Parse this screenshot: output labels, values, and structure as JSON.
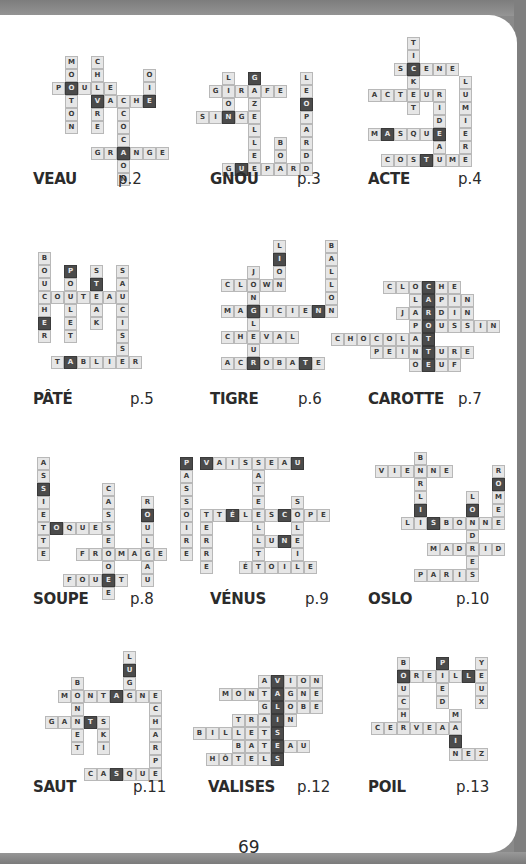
{
  "page_number": "69",
  "colors": {
    "cell_bg": "#e6e6e6",
    "cell_border": "#b8b8b8",
    "highlight_bg": "#4b4b4b",
    "text": "#2b2b2b"
  },
  "puzzles": [
    {
      "answer": "VEAU",
      "page": "p.2",
      "origin": [
        52,
        56
      ],
      "label": [
        33,
        180
      ],
      "pageref": [
        118,
        180
      ],
      "words": [
        [
          "MOUTON",
          0,
          1,
          "v"
        ],
        [
          "CHEVRE",
          0,
          3,
          "v"
        ],
        [
          "POULE",
          2,
          0,
          "h"
        ],
        [
          "VACHE",
          3,
          3,
          "h"
        ],
        [
          "COCHON",
          4,
          5,
          "v"
        ],
        [
          "OIE",
          1,
          7,
          "v"
        ],
        [
          "GRANGE",
          7,
          3,
          "h"
        ]
      ],
      "highlights": [
        [
          2,
          1
        ],
        [
          3,
          3
        ],
        [
          3,
          7
        ],
        [
          7,
          5
        ]
      ]
    },
    {
      "answer": "GNOU",
      "page": "p.3",
      "origin": [
        196,
        72
      ],
      "label": [
        210,
        180
      ],
      "pageref": [
        297,
        180
      ],
      "words": [
        [
          "LION",
          0,
          2,
          "v"
        ],
        [
          "GIRAFE",
          1,
          1,
          "h"
        ],
        [
          "GAZELLE",
          0,
          4,
          "v"
        ],
        [
          "SINGE",
          3,
          0,
          "h"
        ],
        [
          "BOA",
          5,
          6,
          "v"
        ],
        [
          "LEOPARD",
          0,
          8,
          "v"
        ],
        [
          "GUEPARD",
          7,
          2,
          "h"
        ]
      ],
      "highlights": [
        [
          0,
          4
        ],
        [
          3,
          2
        ],
        [
          2,
          8
        ],
        [
          7,
          3
        ]
      ]
    },
    {
      "answer": "ACTE",
      "page": "p.4",
      "origin": [
        368,
        37
      ],
      "label": [
        368,
        180
      ],
      "pageref": [
        458,
        180
      ],
      "words": [
        [
          "TICKET",
          0,
          3,
          "v"
        ],
        [
          "SCENE",
          2,
          2,
          "h"
        ],
        [
          "ACTEUR",
          4,
          0,
          "h"
        ],
        [
          "RIDEAU",
          4,
          5,
          "v"
        ],
        [
          "LUMIERE",
          3,
          7,
          "v"
        ],
        [
          "MASQUE",
          7,
          0,
          "h"
        ],
        [
          "COSTUME",
          9,
          1,
          "h"
        ]
      ],
      "highlights": [
        [
          2,
          3
        ],
        [
          7,
          1
        ],
        [
          7,
          5
        ],
        [
          9,
          4
        ]
      ]
    },
    {
      "answer": "PÂTÉ",
      "page": "p.5",
      "origin": [
        38,
        252
      ],
      "label": [
        33,
        400
      ],
      "pageref": [
        130,
        400
      ],
      "words": [
        [
          "BOUCHER",
          0,
          0,
          "v"
        ],
        [
          "POULET",
          1,
          2,
          "v"
        ],
        [
          "STEAK",
          1,
          4,
          "v"
        ],
        [
          "SAUCISSE",
          1,
          6,
          "v"
        ],
        [
          "COUTEAU",
          3,
          0,
          "h"
        ],
        [
          "TABLIER",
          8,
          1,
          "h"
        ]
      ],
      "highlights": [
        [
          1,
          2
        ],
        [
          2,
          4
        ],
        [
          5,
          0
        ],
        [
          8,
          2
        ]
      ]
    },
    {
      "answer": "TIGRE",
      "page": "p.6",
      "origin": [
        208,
        240
      ],
      "label": [
        210,
        400
      ],
      "pageref": [
        298,
        400
      ],
      "words": [
        [
          "LION",
          0,
          5,
          "v"
        ],
        [
          "BALLON",
          0,
          9,
          "v"
        ],
        [
          "JONGLEUR",
          2,
          3,
          "v"
        ],
        [
          "CLOWN",
          3,
          1,
          "h"
        ],
        [
          "MAGICIEN",
          5,
          1,
          "h"
        ],
        [
          "CHEVAL",
          7,
          1,
          "h"
        ],
        [
          "ACROBATE",
          9,
          1,
          "h"
        ]
      ],
      "highlights": [
        [
          1,
          5
        ],
        [
          5,
          3
        ],
        [
          5,
          8
        ],
        [
          9,
          3
        ],
        [
          9,
          7
        ]
      ]
    },
    {
      "answer": "CAROTTE",
      "page": "p.7",
      "origin": [
        331,
        281
      ],
      "label": [
        368,
        400
      ],
      "pageref": [
        458,
        400
      ],
      "words": [
        [
          "CLOCHE",
          0,
          4,
          "h"
        ],
        [
          "LAPIN",
          1,
          6,
          "h"
        ],
        [
          "JARDIN",
          2,
          5,
          "h"
        ],
        [
          "POUSSIN",
          3,
          6,
          "h"
        ],
        [
          "CHOCOLAT",
          4,
          0,
          "h"
        ],
        [
          "PEINTURE",
          5,
          3,
          "h"
        ],
        [
          "OEUF",
          6,
          6,
          "h"
        ]
      ],
      "highlights": [
        [
          0,
          7
        ],
        [
          1,
          7
        ],
        [
          2,
          7
        ],
        [
          3,
          7
        ],
        [
          4,
          7
        ],
        [
          5,
          7
        ],
        [
          6,
          7
        ]
      ]
    },
    {
      "answer": "SOUPE",
      "page": "p.8",
      "origin": [
        37,
        457
      ],
      "label": [
        33,
        600
      ],
      "pageref": [
        130,
        600
      ],
      "words": [
        [
          "ASSIETTE",
          0,
          0,
          "v"
        ],
        [
          "CASSEROLE",
          2,
          5,
          "v"
        ],
        [
          "ROULEAU",
          3,
          8,
          "v"
        ],
        [
          "PASSOIRE",
          0,
          11,
          "v"
        ],
        [
          "TOQUE",
          5,
          0,
          "h"
        ],
        [
          "FROMAGE",
          7,
          3,
          "h"
        ],
        [
          "FOUET",
          9,
          2,
          "h"
        ]
      ],
      "highlights": [
        [
          2,
          0
        ],
        [
          5,
          1
        ],
        [
          4,
          8
        ],
        [
          0,
          11
        ],
        [
          9,
          5
        ]
      ]
    },
    {
      "answer": "VÉNUS",
      "page": "p.9",
      "origin": [
        200,
        457
      ],
      "label": [
        210,
        600
      ],
      "pageref": [
        305,
        600
      ],
      "words": [
        [
          "VAISSEAU",
          0,
          0,
          "h"
        ],
        [
          "SATELLITE",
          0,
          4,
          "v"
        ],
        [
          "TÉLESCOPE",
          4,
          1,
          "h"
        ],
        [
          "SOLEIL",
          3,
          7,
          "v"
        ],
        [
          "TERRE",
          4,
          0,
          "v"
        ],
        [
          "LUNE",
          6,
          4,
          "h"
        ],
        [
          "ÉTOILE",
          8,
          3,
          "h"
        ]
      ],
      "highlights": [
        [
          0,
          0
        ],
        [
          0,
          7
        ],
        [
          4,
          2
        ],
        [
          4,
          6
        ],
        [
          6,
          6
        ]
      ]
    },
    {
      "answer": "OSLO",
      "page": "p.10",
      "origin": [
        375,
        452
      ],
      "label": [
        368,
        600
      ],
      "pageref": [
        456,
        600
      ],
      "words": [
        [
          "BERLIN",
          0,
          3,
          "v"
        ],
        [
          "VIENNE",
          1,
          0,
          "h"
        ],
        [
          "ROME",
          1,
          9,
          "v"
        ],
        [
          "LONDRES",
          3,
          7,
          "v"
        ],
        [
          "LISBONNE",
          5,
          2,
          "h"
        ],
        [
          "MADRID",
          7,
          4,
          "h"
        ],
        [
          "PARIS",
          9,
          3,
          "h"
        ]
      ],
      "highlights": [
        [
          4,
          3
        ],
        [
          5,
          4
        ],
        [
          4,
          7
        ],
        [
          2,
          9
        ]
      ]
    },
    {
      "answer": "SAUT",
      "page": "p.11",
      "origin": [
        45,
        651
      ],
      "label": [
        33,
        788
      ],
      "pageref": [
        133,
        788
      ],
      "words": [
        [
          "LUGE",
          0,
          6,
          "v"
        ],
        [
          "BONNET",
          2,
          2,
          "v"
        ],
        [
          "MONTAGNE",
          3,
          1,
          "h"
        ],
        [
          "ECHARPE",
          3,
          8,
          "v"
        ],
        [
          "GANTS",
          5,
          0,
          "h"
        ],
        [
          "SKI",
          5,
          4,
          "v"
        ],
        [
          "CASQUE",
          9,
          3,
          "h"
        ]
      ],
      "highlights": [
        [
          1,
          6
        ],
        [
          3,
          5
        ],
        [
          5,
          3
        ],
        [
          9,
          5
        ]
      ]
    },
    {
      "answer": "VALISES",
      "page": "p.12",
      "origin": [
        193,
        675
      ],
      "label": [
        208,
        788
      ],
      "pageref": [
        297,
        788
      ],
      "words": [
        [
          "AVION",
          0,
          5,
          "h"
        ],
        [
          "MONTAGNE",
          1,
          2,
          "h"
        ],
        [
          "GLOBE",
          2,
          5,
          "h"
        ],
        [
          "TRAIN",
          3,
          3,
          "h"
        ],
        [
          "BILLETS",
          4,
          0,
          "h"
        ],
        [
          "BATEAU",
          5,
          3,
          "h"
        ],
        [
          "HÔTELS",
          6,
          1,
          "h"
        ]
      ],
      "highlights": [
        [
          0,
          6
        ],
        [
          1,
          6
        ],
        [
          2,
          6
        ],
        [
          3,
          6
        ],
        [
          4,
          6
        ],
        [
          5,
          6
        ],
        [
          6,
          6
        ]
      ]
    },
    {
      "answer": "POIL",
      "page": "p.13",
      "origin": [
        371,
        657
      ],
      "label": [
        368,
        788
      ],
      "pageref": [
        456,
        788
      ],
      "words": [
        [
          "BOUCHE",
          0,
          2,
          "v"
        ],
        [
          "OREILLE",
          1,
          2,
          "h"
        ],
        [
          "PIED",
          0,
          5,
          "v"
        ],
        [
          "YEUX",
          0,
          8,
          "v"
        ],
        [
          "CERVEAU",
          5,
          0,
          "h"
        ],
        [
          "MAIN",
          4,
          6,
          "v"
        ],
        [
          "NEZ",
          7,
          6,
          "h"
        ]
      ],
      "highlights": [
        [
          1,
          2
        ],
        [
          0,
          5
        ],
        [
          1,
          7
        ],
        [
          6,
          6
        ]
      ]
    }
  ]
}
